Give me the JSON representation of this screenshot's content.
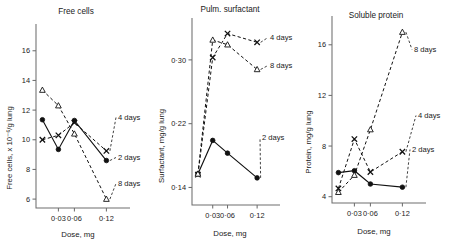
{
  "figure": {
    "panel_count": 3,
    "marker_legend": {
      "2 days": "filled-circle-solid-line",
      "4 days": "cross-dashed-line",
      "8 days": "open-triangle-dashed-line"
    }
  },
  "chart_data": [
    {
      "type": "line",
      "title": "Free cells",
      "xlabel": "Dose, mg",
      "ylabel": "Free cells, x 10⁻⁶/g lung",
      "x": [
        0,
        0.03,
        0.06,
        0.12
      ],
      "xtick_labels": [
        "0·03",
        "0·06",
        "0·12"
      ],
      "xtick_values": [
        0.03,
        0.06,
        0.12
      ],
      "ytick_labels": [
        "6",
        "8",
        "10",
        "12",
        "14",
        "16"
      ],
      "ytick_values": [
        6,
        8,
        10,
        12,
        14,
        16
      ],
      "ylim": [
        5.4,
        17.4
      ],
      "xlim": [
        -0.012,
        0.138
      ],
      "grid": false,
      "legend_position": "inline-right",
      "series": [
        {
          "name": "2 days",
          "label": "2 days",
          "marker": "filled-circle",
          "line": "solid",
          "values": [
            11.35,
            9.35,
            11.3,
            8.6
          ]
        },
        {
          "name": "4 days",
          "label": "4 days",
          "marker": "cross",
          "line": "dashed",
          "values": [
            10.0,
            10.3,
            11.15,
            9.25
          ]
        },
        {
          "name": "8 days",
          "label": "8 days",
          "marker": "open-triangle",
          "line": "dashed",
          "values": [
            13.35,
            12.3,
            10.4,
            6.0
          ]
        }
      ]
    },
    {
      "type": "line",
      "title": "Pulm. surfactant",
      "xlabel": "Dose, mg",
      "ylabel": "Surfactant, mg/g lung",
      "x": [
        0,
        0.03,
        0.06,
        0.12
      ],
      "xtick_labels": [
        "0·03",
        "0·06",
        "0·12"
      ],
      "xtick_values": [
        0.03,
        0.06,
        0.12
      ],
      "ytick_labels": [
        "0·14",
        "0·22",
        "0·30"
      ],
      "ytick_values": [
        0.14,
        0.22,
        0.3
      ],
      "ylim": [
        0.118,
        0.345
      ],
      "xlim": [
        -0.012,
        0.138
      ],
      "grid": false,
      "legend_position": "inline-right",
      "series": [
        {
          "name": "2 days",
          "label": "2 days",
          "marker": "filled-circle",
          "line": "solid",
          "values": [
            0.157,
            0.199,
            0.183,
            0.152
          ]
        },
        {
          "name": "4 days",
          "label": "4 days",
          "marker": "cross",
          "line": "dashed",
          "values": [
            0.156,
            0.303,
            0.333,
            0.322
          ]
        },
        {
          "name": "8 days",
          "label": "8 days",
          "marker": "open-triangle",
          "line": "dashed",
          "values": [
            0.157,
            0.325,
            0.319,
            0.288
          ]
        }
      ]
    },
    {
      "type": "line",
      "title": "Soluble protein",
      "xlabel": "Dose, mg",
      "ylabel": "Protein, mg/g lung",
      "x": [
        0,
        0.03,
        0.06,
        0.12
      ],
      "xtick_labels": [
        "0·03",
        "0·06",
        "0·12"
      ],
      "xtick_values": [
        0.03,
        0.06,
        0.12
      ],
      "ytick_labels": [
        "4",
        "8",
        "12",
        "16"
      ],
      "ytick_values": [
        4,
        8,
        12,
        16
      ],
      "ylim": [
        3.5,
        17.8
      ],
      "xlim": [
        -0.012,
        0.138
      ],
      "grid": false,
      "legend_position": "inline-right",
      "series": [
        {
          "name": "2 days",
          "label": "2 days",
          "marker": "filled-circle",
          "line": "solid",
          "values": [
            5.9,
            6.05,
            5.0,
            4.75
          ]
        },
        {
          "name": "4 days",
          "label": "4 days",
          "marker": "cross",
          "line": "dashed",
          "values": [
            4.65,
            8.55,
            5.95,
            7.55
          ]
        },
        {
          "name": "8 days",
          "label": "8 days",
          "marker": "open-triangle",
          "line": "dashed",
          "values": [
            4.35,
            5.7,
            9.3,
            17.0
          ]
        }
      ]
    }
  ]
}
